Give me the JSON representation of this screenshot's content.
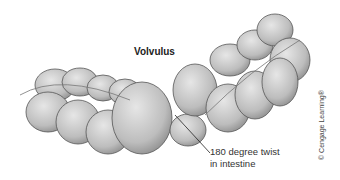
{
  "diagram": {
    "title": "Volvulus",
    "annotation": {
      "line1": "180 degree twist",
      "line2": "in intestine"
    },
    "credit": "© Cengage Learning®",
    "colors": {
      "tissue": "#c9c9c9",
      "outline": "#555555",
      "shadow": "#9a9a9a"
    }
  }
}
